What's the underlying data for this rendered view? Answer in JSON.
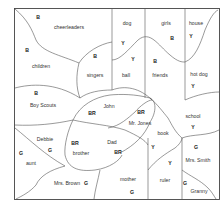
{
  "diagram": {
    "type": "region-map",
    "regions": [
      {
        "name": "cheerleaders",
        "code": "B",
        "label_pos": [
          69,
          28
        ],
        "code_pos": [
          38,
          17
        ]
      },
      {
        "name": "children",
        "code": "B",
        "label_pos": [
          41,
          67
        ],
        "code_pos": [
          27,
          50
        ]
      },
      {
        "name": "singers",
        "code": "B",
        "label_pos": [
          95,
          76
        ],
        "code_pos": [
          95,
          56
        ]
      },
      {
        "name": "dog",
        "code": "Y",
        "label_pos": [
          127,
          24
        ],
        "code_pos": [
          123,
          43
        ]
      },
      {
        "name": "ball",
        "code": "Y",
        "label_pos": [
          126,
          76
        ],
        "code_pos": [
          133,
          59
        ]
      },
      {
        "name": "girls",
        "code": "B",
        "label_pos": [
          166,
          24
        ],
        "code_pos": [
          172,
          38
        ]
      },
      {
        "name": "friends",
        "code": "B",
        "label_pos": [
          160,
          76
        ],
        "code_pos": [
          155,
          61
        ]
      },
      {
        "name": "house",
        "code": "Y",
        "label_pos": [
          196,
          24
        ],
        "code_pos": [
          191,
          36
        ]
      },
      {
        "name": "hot dog",
        "code": "Y",
        "label_pos": [
          199,
          75
        ],
        "code_pos": [
          193,
          86
        ]
      },
      {
        "name": "Boy Scouts",
        "code": "B",
        "label_pos": [
          43,
          106
        ],
        "code_pos": [
          36,
          93
        ]
      },
      {
        "name": "John",
        "code": "BR",
        "label_pos": [
          109,
          107
        ],
        "code_pos": [
          92,
          113
        ]
      },
      {
        "name": "Mr. Jones",
        "code": "BR",
        "label_pos": [
          140,
          124
        ],
        "code_pos": [
          141,
          112
        ]
      },
      {
        "name": "school",
        "code": "Y",
        "label_pos": [
          193,
          117
        ],
        "code_pos": [
          193,
          127
        ]
      },
      {
        "name": "Debbie",
        "code": "G",
        "label_pos": [
          45,
          140
        ],
        "code_pos": [
          50,
          150
        ]
      },
      {
        "name": "aunt",
        "code": "G",
        "label_pos": [
          31,
          164
        ],
        "code_pos": [
          21,
          153
        ]
      },
      {
        "name": "brother",
        "code": "BR",
        "label_pos": [
          79,
          154
        ],
        "code_pos": [
          75,
          143
        ]
      },
      {
        "name": "Dad",
        "code": "BR",
        "label_pos": [
          112,
          143
        ],
        "code_pos": [
          118,
          152
        ]
      },
      {
        "name": "book",
        "code": "Y",
        "label_pos": [
          163,
          134
        ],
        "code_pos": [
          153,
          147
        ]
      },
      {
        "name": "Mrs. Smith",
        "code": "G",
        "label_pos": [
          198,
          161
        ],
        "code_pos": [
          196,
          147
        ]
      },
      {
        "name": "Mrs. Brown",
        "code": "G",
        "label_pos": [
          67,
          184
        ],
        "code_pos": [
          86,
          183
        ]
      },
      {
        "name": "mother",
        "code": "G",
        "label_pos": [
          128,
          180
        ],
        "code_pos": [
          132,
          192
        ]
      },
      {
        "name": "ruler",
        "code": "Y",
        "label_pos": [
          165,
          181
        ],
        "code_pos": [
          170,
          163
        ]
      },
      {
        "name": "Granny",
        "code": "G",
        "label_pos": [
          199,
          192
        ],
        "code_pos": [
          185,
          183
        ]
      }
    ],
    "legend_codes": [
      "B",
      "Y",
      "BR",
      "G"
    ],
    "colors": {
      "background": "#ffffff",
      "line": "#555555",
      "text": "#333333"
    }
  }
}
